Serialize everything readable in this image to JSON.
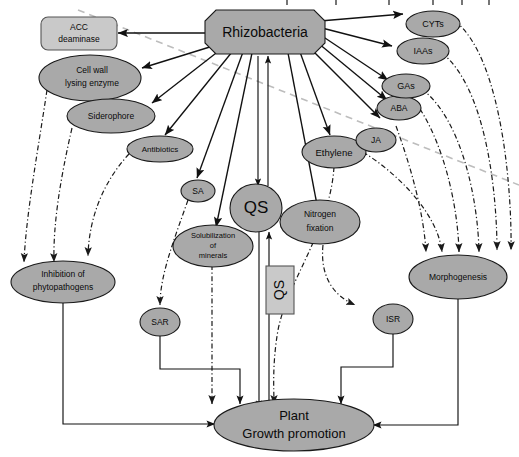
{
  "figure": {
    "colors": {
      "node_fill": "#a9a9a9",
      "node_fill_light": "#c9c9c9",
      "node_stroke": "#1a1a1a",
      "solid_arrow": "#111111",
      "dashdot_arrow": "#1a1a1a",
      "gray_dashed": "#bdbdbd",
      "background": "#ffffff"
    }
  },
  "nodes": {
    "rhizobacteria": {
      "label": "Rhizobacteria",
      "shape": "octagon"
    },
    "acc_deaminase": {
      "label_line1": "ACC",
      "label_line2": "deaminase",
      "shape": "rounded-rect"
    },
    "cell_wall": {
      "label_line1": "Cell wall",
      "label_line2": "lysing enzyme",
      "shape": "ellipse"
    },
    "siderophore": {
      "label": "Siderophore",
      "shape": "ellipse"
    },
    "antibiotics": {
      "label": "Antibiotics",
      "shape": "ellipse"
    },
    "sa": {
      "label": "SA",
      "shape": "ellipse"
    },
    "qs_center": {
      "label": "QS",
      "shape": "ellipse"
    },
    "qs_box": {
      "label": "QS",
      "shape": "rect-rotated"
    },
    "solubilization": {
      "label_line1": "Solubilization",
      "label_line2": "of",
      "label_line3": "minerals",
      "shape": "ellipse"
    },
    "nitrogen_fixation": {
      "label_line1": "Nitrogen",
      "label_line2": "fixation",
      "shape": "ellipse"
    },
    "ethylene": {
      "label": "Ethylene",
      "shape": "ellipse"
    },
    "ja": {
      "label": "JA",
      "shape": "ellipse"
    },
    "aba": {
      "label": "ABA",
      "shape": "ellipse"
    },
    "gas": {
      "label": "GAs",
      "shape": "ellipse"
    },
    "iaas": {
      "label": "IAAs",
      "shape": "ellipse"
    },
    "cyts": {
      "label": "CYTs",
      "shape": "ellipse"
    },
    "inhibition": {
      "label_line1": "Inhibition of",
      "label_line2": "phytopathogens",
      "shape": "ellipse"
    },
    "sar": {
      "label": "SAR",
      "shape": "ellipse"
    },
    "isr": {
      "label": "ISR",
      "shape": "ellipse"
    },
    "morphogenesis": {
      "label": "Morphogenesis",
      "shape": "ellipse"
    },
    "plant_growth": {
      "label_line1": "Plant",
      "label_line2": "Growth promotion",
      "shape": "ellipse"
    }
  },
  "edges": [
    {
      "from": "rhizobacteria",
      "to": "acc_deaminase",
      "style": "solid"
    },
    {
      "from": "rhizobacteria",
      "to": "cell_wall",
      "style": "solid"
    },
    {
      "from": "rhizobacteria",
      "to": "siderophore",
      "style": "solid"
    },
    {
      "from": "rhizobacteria",
      "to": "antibiotics",
      "style": "solid"
    },
    {
      "from": "rhizobacteria",
      "to": "sa",
      "style": "solid"
    },
    {
      "from": "rhizobacteria",
      "to": "solubilization",
      "style": "solid"
    },
    {
      "from": "rhizobacteria",
      "to": "qs_center",
      "style": "solid-bidirectional"
    },
    {
      "from": "rhizobacteria",
      "to": "nitrogen_fixation",
      "style": "solid"
    },
    {
      "from": "rhizobacteria",
      "to": "ethylene",
      "style": "solid"
    },
    {
      "from": "rhizobacteria",
      "to": "ja",
      "style": "solid"
    },
    {
      "from": "rhizobacteria",
      "to": "aba",
      "style": "solid"
    },
    {
      "from": "rhizobacteria",
      "to": "gas",
      "style": "solid"
    },
    {
      "from": "rhizobacteria",
      "to": "iaas",
      "style": "solid"
    },
    {
      "from": "rhizobacteria",
      "to": "cyts",
      "style": "solid"
    },
    {
      "from": "cell_wall",
      "to": "inhibition",
      "style": "dash-dot"
    },
    {
      "from": "siderophore",
      "to": "inhibition",
      "style": "dash-dot"
    },
    {
      "from": "antibiotics",
      "to": "inhibition",
      "style": "dash-dot"
    },
    {
      "from": "sa",
      "to": "sar",
      "style": "dash-dot"
    },
    {
      "from": "solubilization",
      "to": "plant_growth",
      "style": "dash-dot"
    },
    {
      "from": "nitrogen_fixation",
      "to": "isr",
      "style": "dash-dot"
    },
    {
      "from": "ethylene",
      "to": "plant_growth",
      "style": "dash-dot"
    },
    {
      "from": "ja",
      "to": "morphogenesis",
      "style": "dash-dot"
    },
    {
      "from": "aba",
      "to": "morphogenesis",
      "style": "dash-dot"
    },
    {
      "from": "gas",
      "to": "morphogenesis",
      "style": "dash-dot"
    },
    {
      "from": "iaas",
      "to": "morphogenesis",
      "style": "dash-dot"
    },
    {
      "from": "cyts",
      "to": "morphogenesis",
      "style": "dash-dot"
    },
    {
      "from": "inhibition",
      "to": "plant_growth",
      "style": "solid-elbow"
    },
    {
      "from": "sar",
      "to": "plant_growth",
      "style": "solid-elbow"
    },
    {
      "from": "isr",
      "to": "plant_growth",
      "style": "solid-elbow"
    },
    {
      "from": "morphogenesis",
      "to": "plant_growth",
      "style": "solid-elbow"
    },
    {
      "from": "qs_center",
      "to": "plant_growth",
      "style": "solid-bidirectional"
    }
  ]
}
